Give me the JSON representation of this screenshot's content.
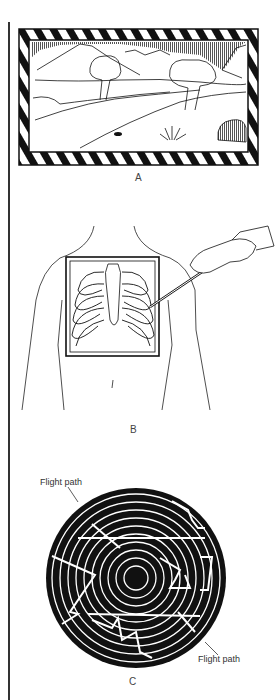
{
  "figure": {
    "panels": [
      {
        "id": "A",
        "label": "A",
        "subject": "framed landscape picture with mountains, trees, path and grass"
      },
      {
        "id": "B",
        "label": "B",
        "subject": "chest X-ray film held against torso with pointer"
      },
      {
        "id": "C",
        "label": "C",
        "subject": "concentric-ring target with flight paths"
      }
    ],
    "annotations": {
      "flight_path_top": "Flight path",
      "flight_path_bottom": "Flight path"
    },
    "colors": {
      "ink": "#111111",
      "background": "#ffffff",
      "label": "#444444"
    }
  }
}
